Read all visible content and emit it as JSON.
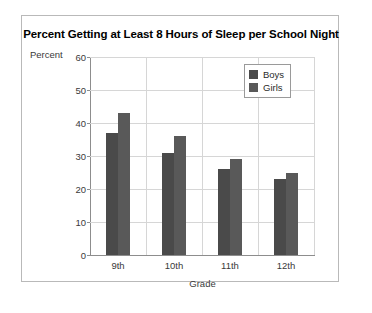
{
  "chart_data": {
    "type": "bar",
    "title": "Percent Getting at Least 8 Hours of Sleep per School Night",
    "xlabel": "Grade",
    "ylabel": "Percent",
    "categories": [
      "9th",
      "10th",
      "11th",
      "12th"
    ],
    "series": [
      {
        "name": "Boys",
        "color": "#4a4a4a",
        "values": [
          37,
          31,
          26,
          23
        ]
      },
      {
        "name": "Girls",
        "color": "#595959",
        "values": [
          43,
          36,
          29,
          25
        ]
      }
    ],
    "ylim": [
      0,
      60
    ],
    "yticks": [
      0,
      10,
      20,
      30,
      40,
      50,
      60
    ],
    "ytick_labels": [
      "0",
      "10",
      "20",
      "30",
      "40",
      "50",
      "60"
    ],
    "grid": "horizontal-and-vertical",
    "legend_position": "top-right"
  },
  "legend": {
    "entries": [
      {
        "label": "Boys"
      },
      {
        "label": "Girls"
      }
    ]
  }
}
